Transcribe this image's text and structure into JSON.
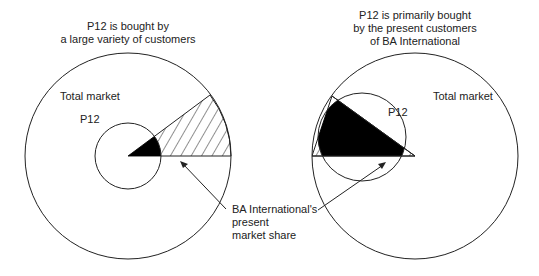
{
  "left_diagram": {
    "title_line1": "P12 is bought by",
    "title_line2": "a large variety of customers",
    "outer_label": "Total market",
    "inner_label": "P12"
  },
  "right_diagram": {
    "title_line1": "P12 is primarily bought",
    "title_line2": "by the present customers",
    "title_line3": "of BA International",
    "outer_label": "Total market",
    "inner_label": "P12"
  },
  "callout": {
    "line1": "BA International's",
    "line2": "present",
    "line3": "market share"
  },
  "colors": {
    "stroke": "#222222",
    "fill_overlap": "#000000",
    "background": "#ffffff"
  }
}
